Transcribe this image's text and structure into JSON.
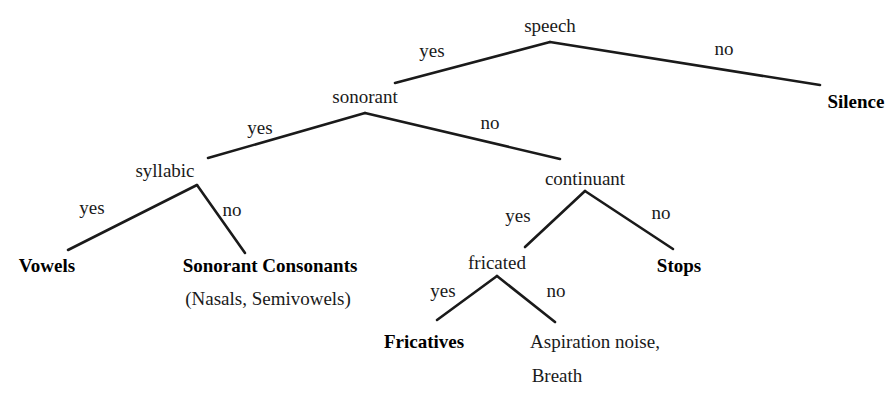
{
  "diagram": {
    "type": "decision-tree",
    "line_color": "#1a1a1a",
    "text_color": "#1a1a1a",
    "background": "#ffffff",
    "nodes": [
      {
        "id": "speech",
        "label": "speech",
        "kind": "decision",
        "x": 550,
        "y": 25
      },
      {
        "id": "sonorant",
        "label": "sonorant",
        "kind": "decision",
        "x": 365,
        "y": 96
      },
      {
        "id": "silence",
        "label": "Silence",
        "kind": "terminal",
        "x": 856,
        "y": 101
      },
      {
        "id": "syllabic",
        "label": "syllabic",
        "kind": "decision",
        "x": 165,
        "y": 170
      },
      {
        "id": "continuant",
        "label": "continuant",
        "kind": "decision",
        "x": 585,
        "y": 178
      },
      {
        "id": "vowels",
        "label": "Vowels",
        "kind": "terminal",
        "x": 47,
        "y": 265
      },
      {
        "id": "sonorant-consonants",
        "label": "Sonorant Consonants",
        "kind": "terminal",
        "x": 270,
        "y": 265
      },
      {
        "id": "sonorant-consonants-sub",
        "label": "(Nasals, Semivowels)",
        "kind": "terminal-sub",
        "x": 268,
        "y": 298
      },
      {
        "id": "fricated",
        "label": "fricated",
        "kind": "decision",
        "x": 497,
        "y": 262
      },
      {
        "id": "stops",
        "label": "Stops",
        "kind": "terminal",
        "x": 679,
        "y": 265
      },
      {
        "id": "fricatives",
        "label": "Fricatives",
        "kind": "terminal",
        "x": 424,
        "y": 341
      },
      {
        "id": "aspiration-noise",
        "label": "Aspiration noise,",
        "kind": "terminal-sub",
        "x": 595,
        "y": 341
      },
      {
        "id": "breath",
        "label": "Breath",
        "kind": "terminal-sub",
        "x": 557,
        "y": 375
      }
    ],
    "edges": [
      {
        "id": "speech-yes",
        "from": "speech",
        "to": "sonorant",
        "x1": 550,
        "y1": 42,
        "x2": 395,
        "y2": 83
      },
      {
        "id": "speech-no",
        "from": "speech",
        "to": "silence",
        "x1": 550,
        "y1": 42,
        "x2": 820,
        "y2": 85
      },
      {
        "id": "sonorant-yes",
        "from": "sonorant",
        "to": "syllabic",
        "x1": 365,
        "y1": 113,
        "x2": 208,
        "y2": 158
      },
      {
        "id": "sonorant-no",
        "from": "sonorant",
        "to": "continuant",
        "x1": 365,
        "y1": 113,
        "x2": 560,
        "y2": 159
      },
      {
        "id": "syllabic-yes",
        "from": "syllabic",
        "to": "vowels",
        "x1": 197,
        "y1": 185,
        "x2": 68,
        "y2": 250
      },
      {
        "id": "syllabic-no",
        "from": "syllabic",
        "to": "sonorant-consonants",
        "x1": 197,
        "y1": 185,
        "x2": 245,
        "y2": 253
      },
      {
        "id": "continuant-yes",
        "from": "continuant",
        "to": "fricated",
        "x1": 585,
        "y1": 191,
        "x2": 525,
        "y2": 247
      },
      {
        "id": "continuant-no",
        "from": "continuant",
        "to": "stops",
        "x1": 585,
        "y1": 191,
        "x2": 673,
        "y2": 249
      },
      {
        "id": "fricated-yes",
        "from": "fricated",
        "to": "fricatives",
        "x1": 497,
        "y1": 276,
        "x2": 437,
        "y2": 320
      },
      {
        "id": "fricated-no",
        "from": "fricated",
        "to": "aspiration-noise",
        "x1": 497,
        "y1": 276,
        "x2": 555,
        "y2": 322
      }
    ],
    "edge_labels": [
      {
        "id": "lbl-speech-yes",
        "text": "yes",
        "x": 432,
        "y": 50
      },
      {
        "id": "lbl-speech-no",
        "text": "no",
        "x": 724,
        "y": 48
      },
      {
        "id": "lbl-sonorant-yes",
        "text": "yes",
        "x": 260,
        "y": 127
      },
      {
        "id": "lbl-sonorant-no",
        "text": "no",
        "x": 490,
        "y": 122
      },
      {
        "id": "lbl-syllabic-yes",
        "text": "yes",
        "x": 92,
        "y": 207
      },
      {
        "id": "lbl-syllabic-no",
        "text": "no",
        "x": 232,
        "y": 209
      },
      {
        "id": "lbl-continuant-yes",
        "text": "yes",
        "x": 518,
        "y": 215
      },
      {
        "id": "lbl-continuant-no",
        "text": "no",
        "x": 661,
        "y": 212
      },
      {
        "id": "lbl-fricated-yes",
        "text": "yes",
        "x": 443,
        "y": 290
      },
      {
        "id": "lbl-fricated-no",
        "text": "no",
        "x": 556,
        "y": 290
      }
    ]
  }
}
